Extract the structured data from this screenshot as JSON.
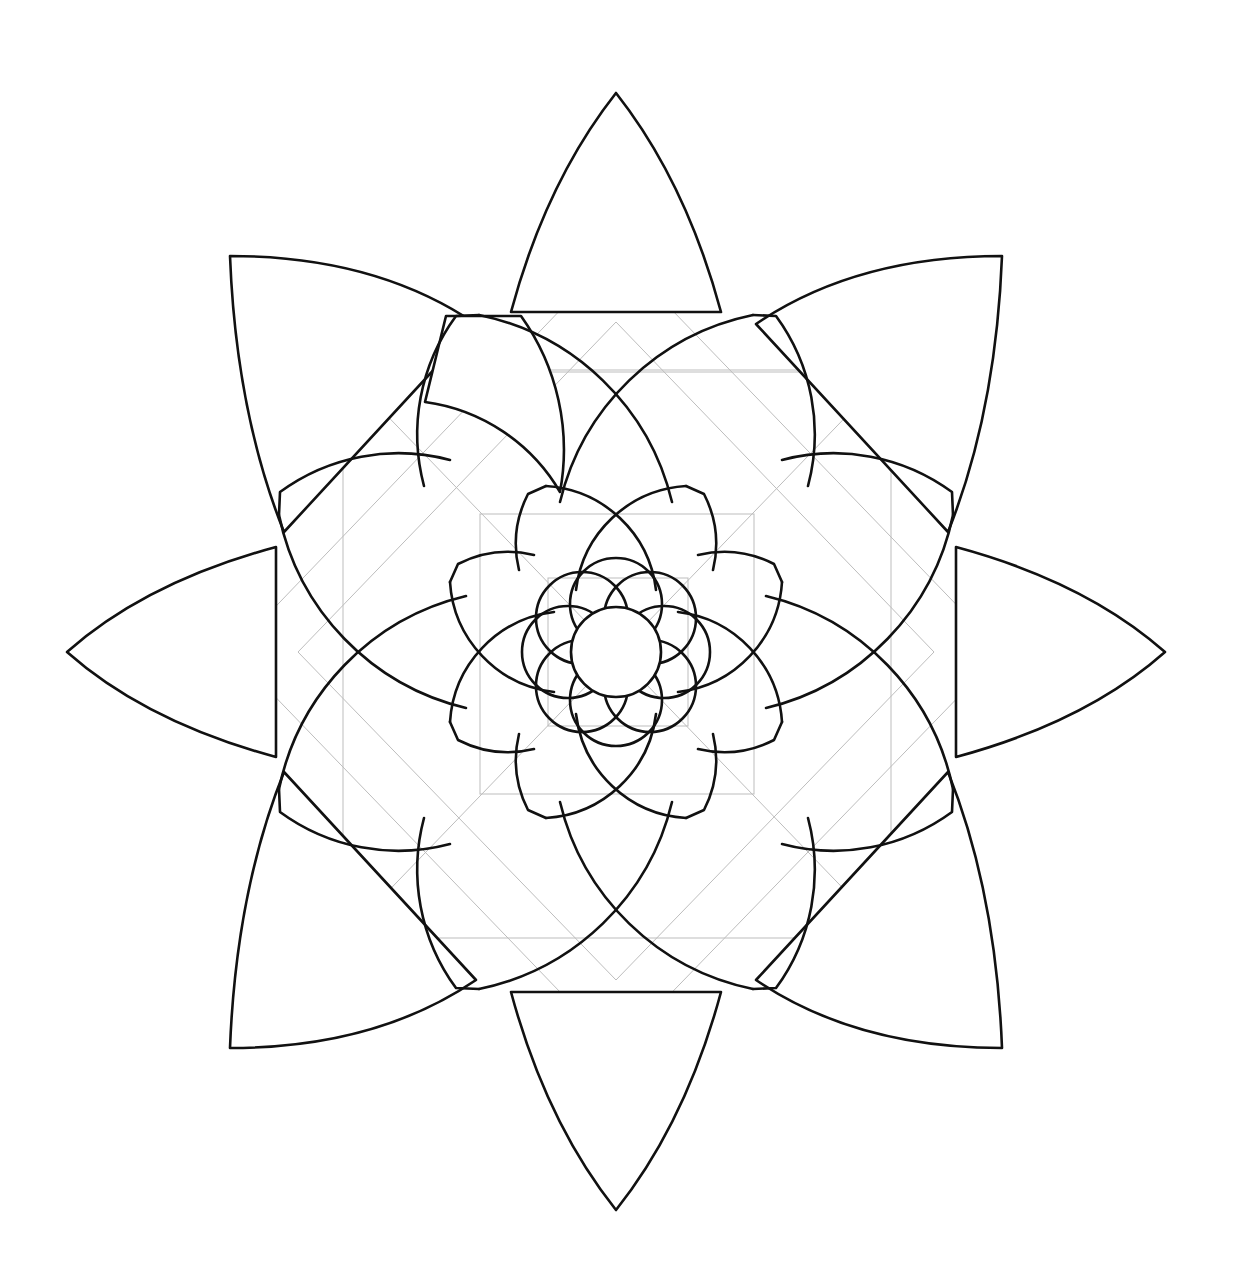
{
  "drawing": {
    "title": "Geometric lotus mandala line drawing",
    "subject": "flower-mandala",
    "style": "black ink outline on white paper with faint pencil guide lines",
    "canvas": {
      "width": 1235,
      "height": 1287,
      "background": "#ffffff"
    },
    "center": {
      "x": 616,
      "y": 652
    },
    "colors": {
      "ink": "#111111",
      "guide": "#bdbdbd",
      "paper": "#ffffff"
    },
    "layers": [
      {
        "name": "outer-petals",
        "count": 8,
        "tip_radius": 558,
        "note": "cardinal petals pointed, diagonal petals with squared corner tips"
      },
      {
        "name": "middle-petals",
        "count": 8,
        "tip_radius": 345,
        "note": "rounded petals with flat-cut tips"
      },
      {
        "name": "inner-petals",
        "count": 8,
        "tip_radius": 175
      },
      {
        "name": "core-petals",
        "count": 8,
        "tip_radius": 95
      },
      {
        "name": "center-disc",
        "radius": 46
      }
    ],
    "guides": [
      {
        "shape": "square",
        "x": 343,
        "y": 370,
        "size": 548
      },
      {
        "shape": "diamond",
        "radius": 400
      },
      {
        "shape": "square",
        "x": 480,
        "y": 514,
        "size": 274
      },
      {
        "shape": "square",
        "x": 548,
        "y": 580,
        "size": 140
      }
    ]
  }
}
